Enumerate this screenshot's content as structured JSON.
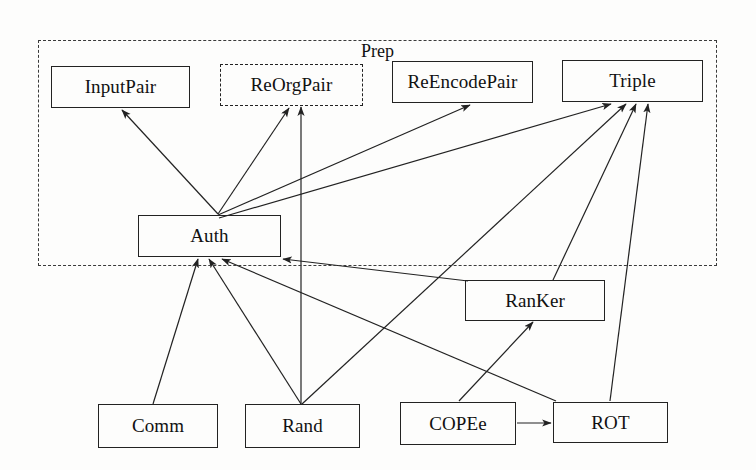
{
  "figure": {
    "type": "module-dependency-diagram",
    "canvas": {
      "width": 756,
      "height": 470
    },
    "background_color": "#fdfdfc",
    "line_color": "#222222",
    "text_color": "#111111"
  },
  "groups": [
    {
      "id": "prep",
      "label": "Prep",
      "style": "dashed",
      "x": 38,
      "y": 40,
      "w": 679,
      "h": 226,
      "label_x": 357,
      "label_y": 40
    }
  ],
  "nodes": [
    {
      "id": "inputpair",
      "label": "InputPair",
      "style": "solid",
      "x": 51,
      "y": 66,
      "w": 139,
      "h": 42,
      "font_size": 19
    },
    {
      "id": "reorgpair",
      "label": "ReOrgPair",
      "style": "dashed",
      "x": 220,
      "y": 64,
      "w": 143,
      "h": 42,
      "font_size": 19
    },
    {
      "id": "reencodepair",
      "label": "ReEncodePair",
      "style": "solid",
      "x": 392,
      "y": 61,
      "w": 141,
      "h": 42,
      "font_size": 19
    },
    {
      "id": "triple",
      "label": "Triple",
      "style": "solid",
      "x": 562,
      "y": 60,
      "w": 141,
      "h": 42,
      "font_size": 19
    },
    {
      "id": "auth",
      "label": "Auth",
      "style": "solid",
      "x": 138,
      "y": 215,
      "w": 143,
      "h": 42,
      "font_size": 19
    },
    {
      "id": "ranker",
      "label": "RanKer",
      "style": "solid",
      "x": 465,
      "y": 280,
      "w": 140,
      "h": 41,
      "font_size": 19
    },
    {
      "id": "comm",
      "label": "Comm",
      "style": "solid",
      "x": 98,
      "y": 404,
      "w": 120,
      "h": 44,
      "font_size": 19
    },
    {
      "id": "rand",
      "label": "Rand",
      "style": "solid",
      "x": 245,
      "y": 404,
      "w": 115,
      "h": 44,
      "font_size": 19
    },
    {
      "id": "copee",
      "label": "COPEe",
      "style": "solid",
      "x": 400,
      "y": 402,
      "w": 116,
      "h": 43,
      "font_size": 19
    },
    {
      "id": "rot",
      "label": "ROT",
      "style": "solid",
      "x": 553,
      "y": 402,
      "w": 115,
      "h": 41,
      "font_size": 19
    }
  ],
  "edges": [
    {
      "id": "auth-inputpair",
      "from": "auth",
      "to": "inputpair",
      "x1": 218,
      "y1": 214,
      "x2": 122,
      "y2": 110,
      "arrow": true
    },
    {
      "id": "auth-reorgpair",
      "from": "auth",
      "to": "reorgpair",
      "x1": 218,
      "y1": 214,
      "x2": 289,
      "y2": 108,
      "arrow": true
    },
    {
      "id": "auth-reencodepair",
      "from": "auth",
      "to": "reencodepair",
      "x1": 218,
      "y1": 215,
      "x2": 470,
      "y2": 105,
      "arrow": true
    },
    {
      "id": "auth-triple",
      "from": "auth",
      "to": "triple",
      "x1": 219,
      "y1": 218,
      "x2": 611,
      "y2": 104,
      "arrow": true
    },
    {
      "id": "rand-reorgpair",
      "from": "rand",
      "to": "reorgpair",
      "x1": 301,
      "y1": 404,
      "x2": 301,
      "y2": 107,
      "arrow": true
    },
    {
      "id": "comm-auth",
      "from": "comm",
      "to": "auth",
      "x1": 153,
      "y1": 404,
      "x2": 198,
      "y2": 259,
      "arrow": true
    },
    {
      "id": "rand-auth",
      "from": "rand",
      "to": "auth",
      "x1": 301,
      "y1": 404,
      "x2": 209,
      "y2": 259,
      "arrow": true
    },
    {
      "id": "rot-auth",
      "from": "rot",
      "to": "auth",
      "x1": 556,
      "y1": 401,
      "x2": 222,
      "y2": 259,
      "arrow": true
    },
    {
      "id": "ranker-auth",
      "from": "ranker",
      "to": "auth",
      "x1": 468,
      "y1": 281,
      "x2": 283,
      "y2": 259,
      "arrow": true
    },
    {
      "id": "rand-triple",
      "from": "rand",
      "to": "triple",
      "x1": 302,
      "y1": 404,
      "x2": 626,
      "y2": 104,
      "arrow": true
    },
    {
      "id": "ranker-triple",
      "from": "ranker",
      "to": "triple",
      "x1": 553,
      "y1": 280,
      "x2": 636,
      "y2": 104,
      "arrow": true
    },
    {
      "id": "rot-triple",
      "from": "rot",
      "to": "triple",
      "x1": 610,
      "y1": 401,
      "x2": 648,
      "y2": 104,
      "arrow": true
    },
    {
      "id": "copee-ranker",
      "from": "copee",
      "to": "ranker",
      "x1": 459,
      "y1": 401,
      "x2": 533,
      "y2": 322,
      "arrow": true
    },
    {
      "id": "copee-rot",
      "from": "copee",
      "to": "rot",
      "x1": 517,
      "y1": 423,
      "x2": 551,
      "y2": 423,
      "arrow": true
    }
  ]
}
